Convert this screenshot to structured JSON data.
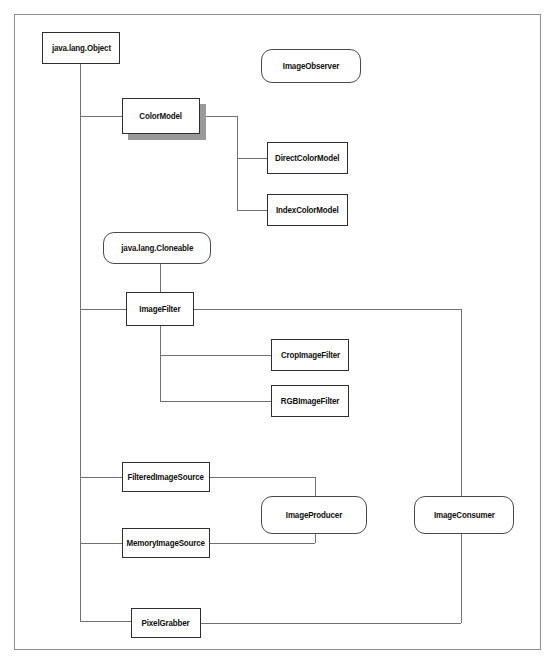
{
  "diagram": {
    "frame": {
      "x": 14,
      "y": 14,
      "width": 527,
      "height": 636
    },
    "line_color": "#6f7174",
    "box_border_color": "#2e2e2e",
    "shadow_color": "#9a9a9a",
    "background": "#ffffff",
    "nodes": [
      {
        "id": "object",
        "label": "java.lang.Object",
        "shape": "class",
        "x": 42,
        "y": 32,
        "w": 78,
        "h": 32,
        "shadow": false
      },
      {
        "id": "imageobserver",
        "label": "ImageObserver",
        "shape": "interface",
        "x": 261,
        "y": 49,
        "w": 100,
        "h": 34,
        "shadow": false
      },
      {
        "id": "colormodel",
        "label": "ColorModel",
        "shape": "class",
        "x": 122,
        "y": 98,
        "w": 78,
        "h": 36,
        "shadow": true
      },
      {
        "id": "directcolormodel",
        "label": "DirectColorModel",
        "shape": "class",
        "x": 267,
        "y": 142,
        "w": 81,
        "h": 32,
        "shadow": false
      },
      {
        "id": "indexcolormodel",
        "label": "IndexColorModel",
        "shape": "class",
        "x": 267,
        "y": 194,
        "w": 81,
        "h": 32,
        "shadow": false
      },
      {
        "id": "cloneable",
        "label": "java.lang.Cloneable",
        "shape": "interface",
        "x": 103,
        "y": 232,
        "w": 108,
        "h": 32,
        "shadow": false
      },
      {
        "id": "imagefilter",
        "label": "ImageFilter",
        "shape": "class",
        "x": 126,
        "y": 292,
        "w": 68,
        "h": 34,
        "shadow": false
      },
      {
        "id": "cropimagefilter",
        "label": "CropImageFilter",
        "shape": "class",
        "x": 271,
        "y": 339,
        "w": 78,
        "h": 32,
        "shadow": false
      },
      {
        "id": "rgbimagefilter",
        "label": "RGBImageFilter",
        "shape": "class",
        "x": 271,
        "y": 385,
        "w": 78,
        "h": 32,
        "shadow": false
      },
      {
        "id": "filteredimagesrc",
        "label": "FilteredImageSource",
        "shape": "class",
        "x": 122,
        "y": 462,
        "w": 88,
        "h": 30,
        "shadow": false
      },
      {
        "id": "imageproducer",
        "label": "ImageProducer",
        "shape": "interface",
        "x": 261,
        "y": 496,
        "w": 106,
        "h": 38,
        "shadow": false
      },
      {
        "id": "imageconsumer",
        "label": "ImageConsumer",
        "shape": "interface",
        "x": 414,
        "y": 496,
        "w": 100,
        "h": 38,
        "shadow": false
      },
      {
        "id": "memoryimagesrc",
        "label": "MemoryImageSource",
        "shape": "class",
        "x": 122,
        "y": 528,
        "w": 88,
        "h": 30,
        "shadow": false
      },
      {
        "id": "pixelgrabber",
        "label": "PixelGrabber",
        "shape": "class",
        "x": 131,
        "y": 608,
        "w": 70,
        "h": 30,
        "shadow": false
      }
    ],
    "connectors": [
      {
        "id": "object-trunk-vertical",
        "orient": "v",
        "x": 80,
        "y1": 64,
        "y2": 621
      },
      {
        "id": "object-bottom-stub",
        "orient": "v",
        "x": 80,
        "y1": 64,
        "y2": 116
      },
      {
        "id": "trunk-to-colormodel",
        "orient": "h",
        "y": 116,
        "x1": 80,
        "x2": 122
      },
      {
        "id": "colormodel-right-stub",
        "orient": "h",
        "y": 116,
        "x1": 200,
        "x2": 237
      },
      {
        "id": "colormodel-branch-vertical",
        "orient": "v",
        "x": 237,
        "y1": 116,
        "y2": 210
      },
      {
        "id": "branch-to-directcolormodel",
        "orient": "h",
        "y": 158,
        "x1": 237,
        "x2": 267
      },
      {
        "id": "branch-to-indexcolormodel",
        "orient": "h",
        "y": 210,
        "x1": 237,
        "x2": 267
      },
      {
        "id": "cloneable-to-imagefilter",
        "orient": "v",
        "x": 160,
        "y1": 264,
        "y2": 292
      },
      {
        "id": "trunk-to-imagefilter",
        "orient": "h",
        "y": 309,
        "x1": 80,
        "x2": 126
      },
      {
        "id": "imagefilter-right-run",
        "orient": "h",
        "y": 309,
        "x1": 194,
        "x2": 461
      },
      {
        "id": "imagefilter-to-consumer",
        "orient": "v",
        "x": 461,
        "y1": 309,
        "y2": 515
      },
      {
        "id": "imagefilter-bottom-vertical",
        "orient": "v",
        "x": 160,
        "y1": 326,
        "y2": 401
      },
      {
        "id": "branch-to-cropimagefilter",
        "orient": "h",
        "y": 355,
        "x1": 160,
        "x2": 271
      },
      {
        "id": "branch-to-rgbimagefilter",
        "orient": "h",
        "y": 401,
        "x1": 160,
        "x2": 271
      },
      {
        "id": "trunk-to-filteredimagesrc",
        "orient": "h",
        "y": 477,
        "x1": 80,
        "x2": 122
      },
      {
        "id": "filteredsrc-to-producer",
        "orient": "h",
        "y": 477,
        "x1": 210,
        "x2": 315
      },
      {
        "id": "producer-vertical",
        "orient": "v",
        "x": 315,
        "y1": 477,
        "y2": 543
      },
      {
        "id": "trunk-to-memoryimagesrc",
        "orient": "h",
        "y": 543,
        "x1": 80,
        "x2": 122
      },
      {
        "id": "memorysrc-to-producer",
        "orient": "h",
        "y": 543,
        "x1": 210,
        "x2": 315
      },
      {
        "id": "consumer-top-vertical",
        "orient": "v",
        "x": 461,
        "y1": 496,
        "y2": 515
      },
      {
        "id": "consumer-bottom-vertical",
        "orient": "v",
        "x": 461,
        "y1": 534,
        "y2": 623
      },
      {
        "id": "trunk-to-pixelgrabber",
        "orient": "h",
        "y": 621,
        "x1": 80,
        "x2": 131
      },
      {
        "id": "pixelgrabber-to-consumer",
        "orient": "h",
        "y": 623,
        "x1": 201,
        "x2": 461
      }
    ]
  }
}
